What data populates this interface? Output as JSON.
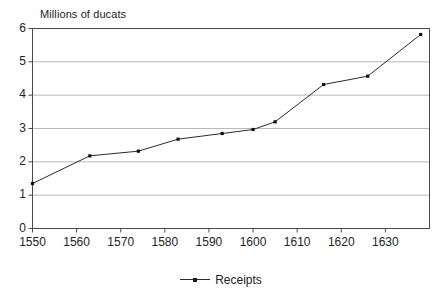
{
  "chart_data": {
    "type": "line",
    "title": "",
    "ylabel": "Millions of ducats",
    "xlabel": "",
    "ylim": [
      0,
      6
    ],
    "xlim": [
      1550,
      1640
    ],
    "grid": true,
    "legend_position": "bottom-center",
    "ytick_labels": [
      "6",
      "5",
      "4",
      "3",
      "2",
      "1",
      "0"
    ],
    "ytick_values": [
      6,
      5,
      4,
      3,
      2,
      1,
      0
    ],
    "xtick_labels": [
      "1550",
      "1560",
      "1570",
      "1580",
      "1590",
      "1600",
      "1610",
      "1620",
      "1630"
    ],
    "xtick_values": [
      1550,
      1560,
      1570,
      1580,
      1590,
      1600,
      1610,
      1620,
      1630
    ],
    "series": [
      {
        "name": "Receipts",
        "color": "#2b2b2b",
        "marker": "square",
        "x": [
          1550,
          1563,
          1574,
          1583,
          1593,
          1600,
          1605,
          1616,
          1626,
          1638
        ],
        "values": [
          1.35,
          2.18,
          2.32,
          2.68,
          2.85,
          2.97,
          3.2,
          4.32,
          4.57,
          5.82
        ]
      }
    ]
  },
  "legend": {
    "entries": [
      {
        "label": "Receipts"
      }
    ]
  }
}
